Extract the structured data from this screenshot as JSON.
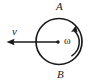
{
  "figure": {
    "type": "physics-diagram",
    "background_color": "#ffffff",
    "stroke_color": "#1a1a1a",
    "labels": {
      "top_point": "A",
      "bottom_point": "B",
      "velocity": "v",
      "angular_velocity": "ω"
    },
    "icons": {
      "wheel": "circle-outline-icon",
      "center": "center-dot-icon",
      "velocity_vector": "left-arrow-icon",
      "rotation_arrow": "curved-arrow-counterclockwise-icon"
    },
    "geometry": {
      "circle_center_x": 59,
      "circle_center_y": 41.5,
      "circle_radius": 23,
      "circle_stroke_width": 1.6,
      "center_dot_x": 58,
      "center_dot_y": 42,
      "center_dot_radius": 1.6,
      "velocity_arrow_start_x": 58,
      "velocity_arrow_start_y": 42,
      "velocity_arrow_end_x": 7,
      "velocity_arrow_end_y": 42,
      "velocity_arrow_stroke_width": 1.3,
      "rotation_arc_radius": 16,
      "rotation_arc_stroke_width": 1.4,
      "rotation_arc_start_x": 71.5,
      "rotation_arc_start_y": 55.5,
      "rotation_arc_end_x": 74.5,
      "rotation_arc_end_y": 29.5
    }
  }
}
